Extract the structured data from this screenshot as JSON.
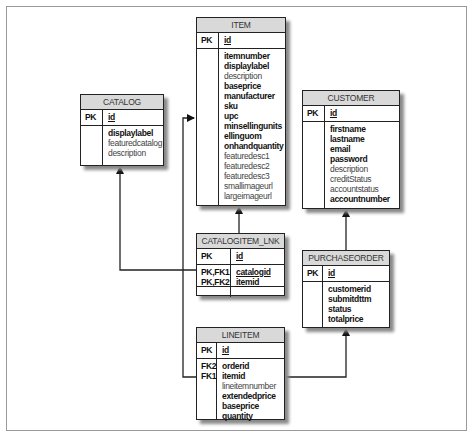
{
  "diagram": {
    "type": "entity-relationship",
    "entities": {
      "item": {
        "name": "ITEM",
        "pk_label": "PK",
        "pk_field": "id",
        "fields": [
          {
            "name": "itemnumber",
            "bold": true
          },
          {
            "name": "displaylabel",
            "bold": true
          },
          {
            "name": "description",
            "bold": false
          },
          {
            "name": "baseprice",
            "bold": true
          },
          {
            "name": "manufacturer",
            "bold": true
          },
          {
            "name": "sku",
            "bold": true
          },
          {
            "name": "upc",
            "bold": true
          },
          {
            "name": "minsellingunits",
            "bold": true
          },
          {
            "name": "ellinguom",
            "bold": true
          },
          {
            "name": "onhandquantity",
            "bold": true
          },
          {
            "name": "featuredesc1",
            "bold": false
          },
          {
            "name": "featuredesc2",
            "bold": false
          },
          {
            "name": "featuredesc3",
            "bold": false
          },
          {
            "name": "smallimageurl",
            "bold": false
          },
          {
            "name": "largeimageurl",
            "bold": false
          }
        ]
      },
      "catalog": {
        "name": "CATALOG",
        "pk_label": "PK",
        "pk_field": "id",
        "fields": [
          {
            "name": "displaylabel",
            "bold": true
          },
          {
            "name": "featuredcatalog",
            "bold": false
          },
          {
            "name": "description",
            "bold": false
          }
        ]
      },
      "customer": {
        "name": "CUSTOMER",
        "pk_label": "PK",
        "pk_field": "id",
        "fields": [
          {
            "name": "firstname",
            "bold": true
          },
          {
            "name": "lastname",
            "bold": true
          },
          {
            "name": "email",
            "bold": true
          },
          {
            "name": "password",
            "bold": true
          },
          {
            "name": "description",
            "bold": false
          },
          {
            "name": "creditStatus",
            "bold": false
          },
          {
            "name": "accountstatus",
            "bold": false
          },
          {
            "name": "accountnumber",
            "bold": true
          }
        ]
      },
      "catalogitem_lnk": {
        "name": "CATALOGITEM_LNK",
        "pk_label": "PK",
        "pk_field": "id",
        "key_labels": [
          "PK,FK1",
          "PK,FK2"
        ],
        "fields": [
          {
            "name": "catalogid",
            "bold": true,
            "underline": true
          },
          {
            "name": "itemid",
            "bold": true,
            "underline": true
          }
        ]
      },
      "purchaseorder": {
        "name": "PURCHASEORDER",
        "pk_label": "PK",
        "pk_field": "id",
        "fields": [
          {
            "name": "customerid",
            "bold": true
          },
          {
            "name": "submitdttm",
            "bold": true
          },
          {
            "name": "status",
            "bold": true
          },
          {
            "name": "totalprice",
            "bold": true
          }
        ]
      },
      "lineitem": {
        "name": "LINEITEM",
        "pk_label": "PK",
        "pk_field": "id",
        "key_labels": [
          "FK2",
          "FK1"
        ],
        "fields": [
          {
            "name": "orderid",
            "bold": true
          },
          {
            "name": "itemid",
            "bold": true
          },
          {
            "name": "lineitemnumber",
            "bold": false
          },
          {
            "name": "extendedprice",
            "bold": true
          },
          {
            "name": "baseprice",
            "bold": true
          },
          {
            "name": "quantity",
            "bold": true
          }
        ]
      }
    },
    "relationships": [
      {
        "from": "CATALOGITEM_LNK",
        "to": "ITEM"
      },
      {
        "from": "CATALOGITEM_LNK",
        "to": "CATALOG"
      },
      {
        "from": "LINEITEM",
        "to": "ITEM"
      },
      {
        "from": "LINEITEM",
        "to": "PURCHASEORDER"
      },
      {
        "from": "PURCHASEORDER",
        "to": "CUSTOMER"
      }
    ],
    "colors": {
      "border": "#222222",
      "header_bg": "#d9d9d9",
      "shadow": "#8a8a8a",
      "frame": "#9a9a9a"
    }
  }
}
